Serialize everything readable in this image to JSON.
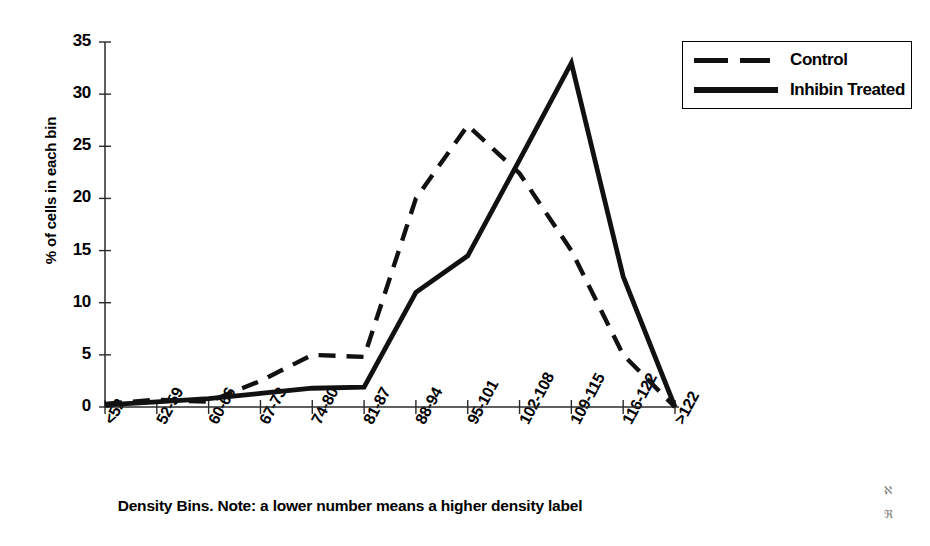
{
  "chart_data": {
    "type": "line",
    "title": "",
    "subtitle": "",
    "xlabel": "Density Bins. Note: a lower number means a higher density label",
    "ylabel": "% of cells in each bin",
    "categories": [
      "<52",
      "52-59",
      "60-66",
      "67-73",
      "74-80",
      "81-87",
      "88-94",
      "95-101",
      "102-108",
      "109-115",
      "116-122",
      ">122"
    ],
    "ylim": [
      0,
      35
    ],
    "yticks": [
      0,
      5,
      10,
      15,
      20,
      25,
      30,
      35
    ],
    "ytick_labels": [
      "0",
      "5",
      "10",
      "15",
      "20",
      "25",
      "30",
      "35"
    ],
    "grid": false,
    "legend_position": "top-right",
    "series": [
      {
        "name": "Control",
        "style": "dashed",
        "color": "#111111",
        "values": [
          0.3,
          0.7,
          0.5,
          2.5,
          5.0,
          4.8,
          20.0,
          27.0,
          22.4,
          15.0,
          5.0,
          0.0
        ]
      },
      {
        "name": "Inhibin Treated",
        "style": "solid",
        "color": "#111111",
        "values": [
          0.2,
          0.5,
          0.8,
          1.3,
          1.8,
          1.9,
          11.0,
          14.5,
          23.7,
          33.0,
          12.5,
          0.0
        ]
      }
    ]
  },
  "legend": {
    "entries": [
      {
        "label": "Control",
        "style": "dashed"
      },
      {
        "label": "Inhibin Treated",
        "style": "solid"
      }
    ]
  },
  "axes": {
    "y_title": "% of cells in each bin",
    "x_title": "Density Bins. Note: a lower number means a higher density label"
  },
  "artifacts": {
    "mark_1": "ℵ",
    "mark_2": "ℜ"
  }
}
